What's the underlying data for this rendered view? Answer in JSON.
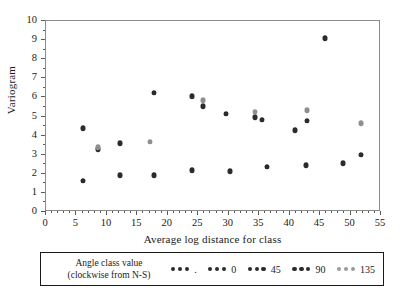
{
  "chart_data": {
    "type": "scatter",
    "title": "",
    "xlabel": "Average log distance for class",
    "ylabel": "Variogram",
    "xlim": [
      0,
      55
    ],
    "ylim": [
      0,
      10
    ],
    "xticks": [
      0,
      5,
      10,
      15,
      20,
      25,
      30,
      35,
      40,
      45,
      50,
      55
    ],
    "yticks": [
      0,
      1,
      2,
      3,
      4,
      5,
      6,
      7,
      8,
      9,
      10
    ],
    "grid": false,
    "legend_position": "below",
    "series": [
      {
        "name": ".",
        "color": "#2b2b2b",
        "points": []
      },
      {
        "name": "0",
        "color": "#2b2b2b",
        "points": [
          [
            6.2,
            4.35
          ],
          [
            8.7,
            3.25
          ],
          [
            12.3,
            3.55
          ],
          [
            17.9,
            6.2
          ],
          [
            24.1,
            6.02
          ],
          [
            25.9,
            5.5
          ],
          [
            29.7,
            5.1
          ],
          [
            34.5,
            4.92
          ],
          [
            35.6,
            4.77
          ],
          [
            41.1,
            4.22
          ],
          [
            43.0,
            4.72
          ],
          [
            45.9,
            9.05
          ],
          [
            51.9,
            2.95
          ]
        ]
      },
      {
        "name": "45",
        "color": "#2b2b2b",
        "points": [
          [
            6.2,
            1.58
          ],
          [
            12.3,
            1.88
          ],
          [
            17.9,
            1.87
          ],
          [
            24.1,
            2.15
          ],
          [
            30.3,
            2.07
          ],
          [
            36.4,
            2.32
          ],
          [
            42.9,
            2.4
          ],
          [
            48.9,
            2.5
          ]
        ]
      },
      {
        "name": "90",
        "color": "#2b2b2b",
        "points": []
      },
      {
        "name": "135",
        "color": "#8f8f8f",
        "points": [
          [
            8.7,
            3.35
          ],
          [
            17.2,
            3.62
          ],
          [
            25.9,
            5.8
          ],
          [
            34.5,
            5.2
          ],
          [
            43.0,
            5.28
          ],
          [
            51.9,
            4.6
          ]
        ]
      }
    ],
    "legend": {
      "title_line1": "Angle class value",
      "title_line2": "(clockwise from N-S)",
      "entries": [
        {
          "label": ".",
          "color": "#2b2b2b"
        },
        {
          "label": "0",
          "color": "#2b2b2b"
        },
        {
          "label": "45",
          "color": "#2b2b2b"
        },
        {
          "label": "90",
          "color": "#2b2b2b"
        },
        {
          "label": "135",
          "color": "#9a9a9a"
        }
      ]
    }
  }
}
